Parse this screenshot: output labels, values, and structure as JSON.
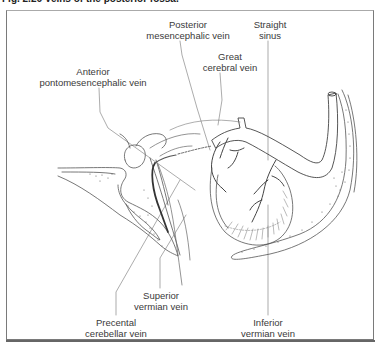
{
  "figure": {
    "title": "Fig. 2.26  Veins of the posterior fossa."
  },
  "labels": [
    {
      "id": "posterior-mesencephalic-vein",
      "line1": "Posterior",
      "line2": "mesencephalic vein",
      "x": 188,
      "y": 19
    },
    {
      "id": "straight-sinus",
      "line1": "Straight",
      "line2": "sinus",
      "x": 270,
      "y": 19
    },
    {
      "id": "great-cerebral-vein",
      "line1": "Great",
      "line2": "cerebral vein",
      "x": 230,
      "y": 51
    },
    {
      "id": "anterior-pontomesencephalic-vein",
      "line1": "Anterior",
      "line2": "pontomesencephalic vein",
      "x": 93,
      "y": 66
    },
    {
      "id": "superior-vermian-vein",
      "line1": "Superior",
      "line2": "vermian vein",
      "x": 161,
      "y": 290
    },
    {
      "id": "precental-cerebellar-vein",
      "line1": "Precental",
      "line2": "cerebellar vein",
      "x": 116,
      "y": 317
    },
    {
      "id": "inferior-vermian-vein",
      "line1": "Inferior",
      "line2": "vermian vein",
      "x": 268,
      "y": 317
    }
  ],
  "colors": {
    "line": "#555555",
    "leader": "#777777",
    "frame": "#7a7a7a"
  }
}
